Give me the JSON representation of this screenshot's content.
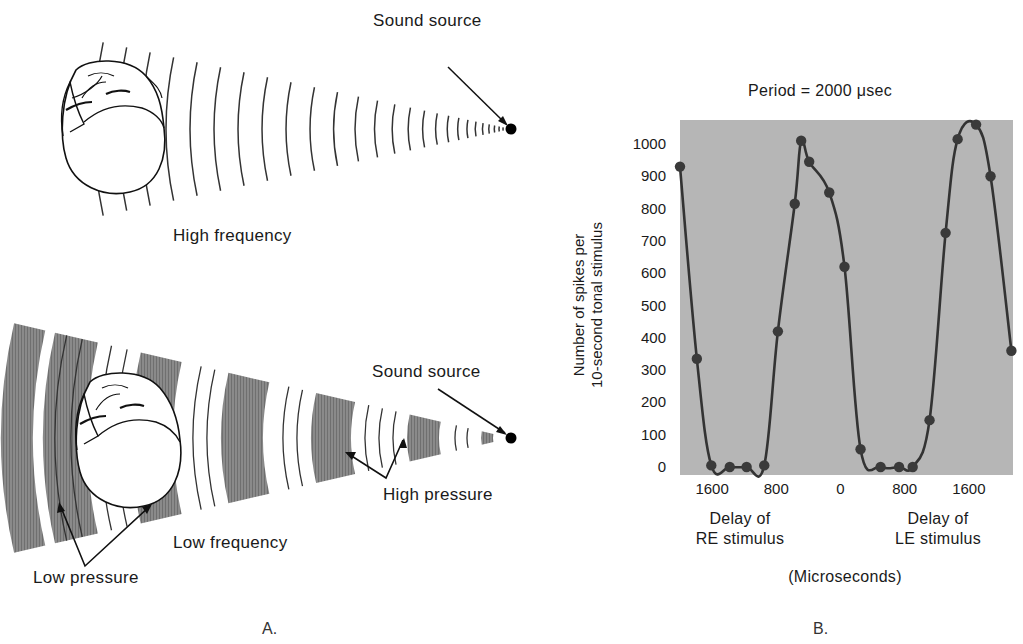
{
  "panel_a": {
    "letter": "A.",
    "top": {
      "source_label": "Sound source",
      "caption": "High frequency"
    },
    "bottom": {
      "source_label": "Sound source",
      "caption": "Low frequency",
      "high_pressure_label": "High pressure",
      "low_pressure_label": "Low pressure"
    }
  },
  "panel_b": {
    "letter": "B.",
    "title": "Period = 2000 μsec",
    "ylabel_line1": "Number of spikes per",
    "ylabel_line2": "10-second tonal stimulus",
    "xlabel_left_line1": "Delay of",
    "xlabel_left_line2": "RE stimulus",
    "xlabel_right_line1": "Delay of",
    "xlabel_right_line2": "LE stimulus",
    "xunits": "(Microseconds)",
    "yticks": [
      "1000",
      "900",
      "800",
      "700",
      "600",
      "500",
      "400",
      "300",
      "200",
      "100",
      "0"
    ],
    "xticks": [
      "1600",
      "800",
      "0",
      "800",
      "1600"
    ]
  },
  "chart_data": {
    "type": "scatter",
    "title": "Period = 2000 μsec",
    "xlabel": "Delay of RE stimulus (negative) / Delay of LE stimulus (positive) (Microseconds)",
    "ylabel": "Number of spikes per 10-second tonal stimulus",
    "x_tick_labels": [
      "1600 (RE)",
      "800 (RE)",
      "0",
      "800 (LE)",
      "1600 (LE)"
    ],
    "x_tick_values": [
      -1600,
      -800,
      0,
      800,
      1600
    ],
    "ylim": [
      0,
      1080
    ],
    "xlim": [
      -2000,
      2150
    ],
    "grid": false,
    "background": "#b8b8b8",
    "series": [
      {
        "name": "Measured spikes",
        "x": [
          -2000,
          -1790,
          -1610,
          -1380,
          -1170,
          -950,
          -780,
          -570,
          -490,
          -390,
          -140,
          50,
          250,
          500,
          730,
          900,
          1110,
          1310,
          1460,
          1690,
          1870,
          2130
        ],
        "y": [
          930,
          335,
          5,
          0,
          0,
          5,
          420,
          815,
          1010,
          945,
          850,
          620,
          55,
          0,
          0,
          0,
          145,
          725,
          1015,
          1060,
          900,
          360
        ]
      }
    ],
    "fit_curve": "smooth periodic curve through points (period 2000 μsec)"
  }
}
